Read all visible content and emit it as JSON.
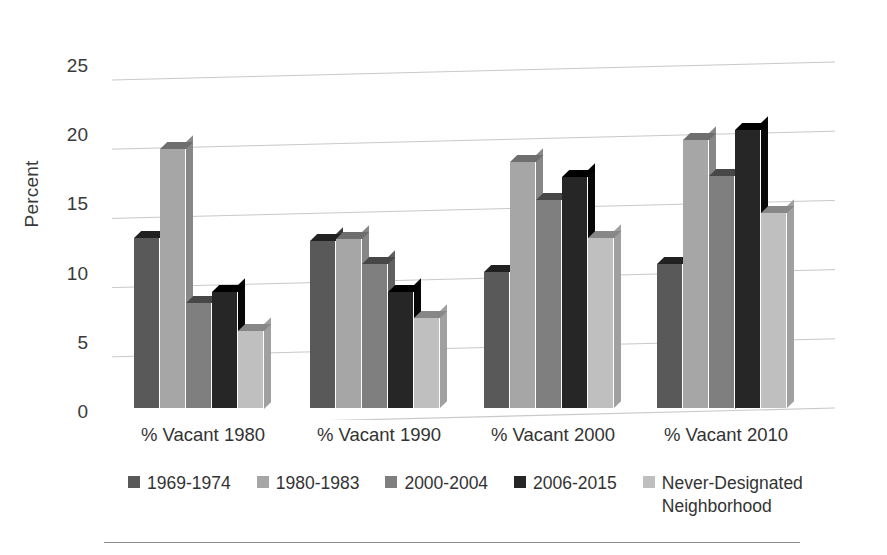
{
  "chart_data": {
    "type": "bar",
    "title": "",
    "xlabel": "",
    "ylabel": "Percent",
    "ylim": [
      0,
      25
    ],
    "ytick_step": 5,
    "yticks": [
      0,
      5,
      10,
      15,
      20,
      25
    ],
    "grid": true,
    "legend_position": "bottom",
    "style": "3d-clustered-column",
    "categories": [
      "% Vacant 1980",
      "% Vacant 1990",
      "% Vacant 2000",
      "% Vacant 2010"
    ],
    "series": [
      {
        "name": "1969-1974",
        "color": "#595959",
        "values": [
          12.3,
          12.1,
          9.8,
          10.4
        ]
      },
      {
        "name": "1980-1983",
        "color": "#a6a6a6",
        "values": [
          18.7,
          12.2,
          17.8,
          19.4
        ]
      },
      {
        "name": "2000-2004",
        "color": "#7f7f7f",
        "values": [
          7.6,
          10.4,
          15.0,
          16.8
        ]
      },
      {
        "name": "2006-2015",
        "color": "#262626",
        "values": [
          8.4,
          8.4,
          16.7,
          20.1
        ]
      },
      {
        "name": "Never-Designated\nNeighborhood",
        "color": "#bfbfbf",
        "values": [
          5.6,
          6.5,
          12.3,
          14.1
        ]
      }
    ]
  },
  "axis": {
    "y_title": "Percent",
    "y_tick_labels": [
      "25",
      "20",
      "15",
      "10",
      "5",
      "0"
    ]
  },
  "legend": {
    "items": [
      {
        "label": "1969-1974",
        "color": "#595959"
      },
      {
        "label": "1980-1983",
        "color": "#a6a6a6"
      },
      {
        "label": "2000-2004",
        "color": "#7f7f7f"
      },
      {
        "label": "2006-2015",
        "color": "#262626"
      },
      {
        "label": "Never-Designated\nNeighborhood",
        "color": "#bfbfbf"
      }
    ]
  },
  "colors": {
    "gridline": "#c9c9c9",
    "text": "#333333",
    "background": "#ffffff",
    "rule": "#8b8b8b"
  }
}
